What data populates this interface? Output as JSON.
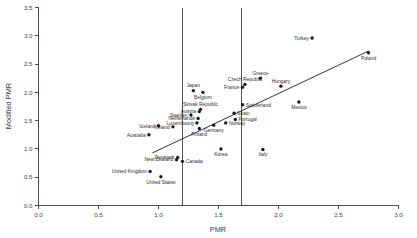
{
  "chart_data": {
    "type": "scatter",
    "title": "",
    "xlabel": "PMR",
    "ylabel": "Modified PMR",
    "xlim": [
      0.0,
      3.0
    ],
    "ylim": [
      0.0,
      3.5
    ],
    "xticks": [
      "0.0",
      "0.5",
      "1.0",
      "1.5",
      "2.0",
      "2.5",
      "3.0"
    ],
    "xtick_values": [
      0.0,
      0.5,
      1.0,
      1.5,
      2.0,
      2.5,
      3.0
    ],
    "yticks": [
      "0.0",
      "0.5",
      "1.0",
      "1.5",
      "2.0",
      "2.5",
      "3.0",
      "3.5"
    ],
    "ytick_values": [
      0.0,
      0.5,
      1.0,
      1.5,
      2.0,
      2.5,
      3.0,
      3.5
    ],
    "grid": false,
    "legend": "none",
    "reference_lines": {
      "vertical": [
        1.2,
        1.69
      ]
    },
    "trend_line": {
      "x_start": 0.95,
      "y_start": 0.93,
      "x_end": 2.75,
      "y_end": 2.73
    },
    "points": [
      {
        "label": "Turkey",
        "x": 2.28,
        "y": 2.96,
        "label_pos": "left"
      },
      {
        "label": "Poland",
        "x": 2.75,
        "y": 2.7,
        "label_pos": "below"
      },
      {
        "label": "Greece",
        "x": 1.85,
        "y": 2.25,
        "label_pos": "above"
      },
      {
        "label": "Czech Republic",
        "x": 1.72,
        "y": 2.14,
        "label_pos": "above"
      },
      {
        "label": "Hungary",
        "x": 2.02,
        "y": 2.11,
        "label_pos": "above"
      },
      {
        "label": "France",
        "x": 1.7,
        "y": 2.09,
        "label_pos": "left"
      },
      {
        "label": "Japan",
        "x": 1.29,
        "y": 2.03,
        "label_pos": "above"
      },
      {
        "label": "Belgium",
        "x": 1.37,
        "y": 2.0,
        "label_pos": "below"
      },
      {
        "label": "Mexico",
        "x": 2.17,
        "y": 1.83,
        "label_pos": "below"
      },
      {
        "label": "Switzerland",
        "x": 1.7,
        "y": 1.78,
        "label_pos": "right"
      },
      {
        "label": "Slovak Republic",
        "x": 1.35,
        "y": 1.7,
        "label_pos": "above"
      },
      {
        "label": "Austria",
        "x": 1.34,
        "y": 1.66,
        "label_pos": "left"
      },
      {
        "label": "Spain",
        "x": 1.63,
        "y": 1.63,
        "label_pos": "right"
      },
      {
        "label": "Sweden",
        "x": 1.27,
        "y": 1.6,
        "label_pos": "left"
      },
      {
        "label": "Netherlands",
        "x": 1.33,
        "y": 1.54,
        "label_pos": "left"
      },
      {
        "label": "Portugal",
        "x": 1.64,
        "y": 1.52,
        "label_pos": "right"
      },
      {
        "label": "Luxembourg",
        "x": 1.32,
        "y": 1.46,
        "label_pos": "left"
      },
      {
        "label": "Norway",
        "x": 1.56,
        "y": 1.46,
        "label_pos": "right"
      },
      {
        "label": "Germany",
        "x": 1.46,
        "y": 1.42,
        "label_pos": "below"
      },
      {
        "label": "Iceland",
        "x": 1.0,
        "y": 1.41,
        "label_pos": "left"
      },
      {
        "label": "Ireland",
        "x": 1.12,
        "y": 1.39,
        "label_pos": "left"
      },
      {
        "label": "Finland",
        "x": 1.34,
        "y": 1.36,
        "label_pos": "below"
      },
      {
        "label": "Australia",
        "x": 0.92,
        "y": 1.25,
        "label_pos": "left"
      },
      {
        "label": "Korea",
        "x": 1.52,
        "y": 1.0,
        "label_pos": "below"
      },
      {
        "label": "Italy",
        "x": 1.87,
        "y": 0.99,
        "label_pos": "below"
      },
      {
        "label": "Denmark",
        "x": 1.16,
        "y": 0.85,
        "label_pos": "left"
      },
      {
        "label": "New Zealand",
        "x": 1.15,
        "y": 0.81,
        "label_pos": "left"
      },
      {
        "label": "Canada",
        "x": 1.2,
        "y": 0.78,
        "label_pos": "right"
      },
      {
        "label": "United Kingdom",
        "x": 0.93,
        "y": 0.6,
        "label_pos": "left"
      },
      {
        "label": "United States",
        "x": 1.02,
        "y": 0.51,
        "label_pos": "below"
      }
    ]
  }
}
